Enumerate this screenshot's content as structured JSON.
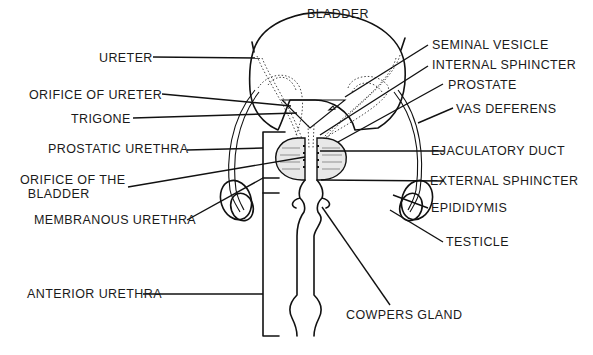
{
  "diagram": {
    "title": "",
    "organ_label": "BLADDER",
    "labels_left": [
      {
        "id": "ureter",
        "text": "URETER"
      },
      {
        "id": "orifice-of-ureter",
        "text": "ORIFICE OF URETER"
      },
      {
        "id": "trigone",
        "text": "TRIGONE"
      },
      {
        "id": "prostatic-urethra",
        "text": "PROSTATIC URETHRA"
      },
      {
        "id": "orifice-of-bladder",
        "text": "ORIFICE OF THE\n  BLADDER"
      },
      {
        "id": "membranous-urethra",
        "text": "MEMBRANOUS URETHRA"
      },
      {
        "id": "anterior-urethra",
        "text": "ANTERIOR URETHRA"
      }
    ],
    "labels_right": [
      {
        "id": "seminal-vesicle",
        "text": "SEMINAL VESICLE"
      },
      {
        "id": "internal-sphincter",
        "text": "INTERNAL SPHINCTER"
      },
      {
        "id": "prostate",
        "text": "PROSTATE"
      },
      {
        "id": "vas-deferens",
        "text": "VAS DEFERENS"
      },
      {
        "id": "ejaculatory-duct",
        "text": "EJACULATORY DUCT"
      },
      {
        "id": "external-sphincter",
        "text": "EXTERNAL SPHINCTER"
      },
      {
        "id": "epididymis",
        "text": "EPIDIDYMIS"
      },
      {
        "id": "testicle",
        "text": "TESTICLE"
      },
      {
        "id": "cowpers-gland",
        "text": "COWPERS GLAND"
      }
    ],
    "colors": {
      "ink": "#111111",
      "background": "#ffffff"
    }
  }
}
